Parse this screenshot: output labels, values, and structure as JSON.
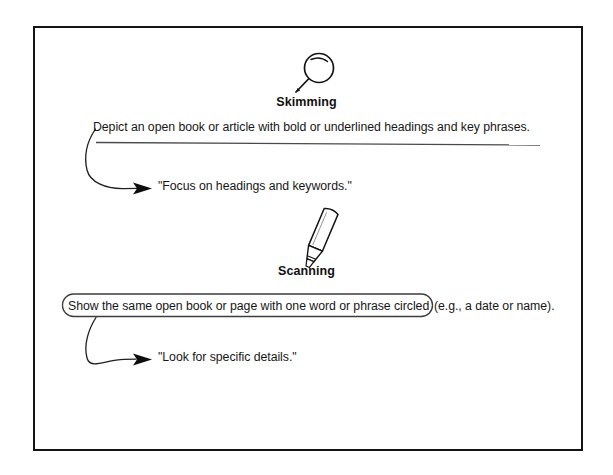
{
  "diagram": {
    "title_hidden": "",
    "sections": [
      {
        "id": "skimming",
        "icon": "magnifying-glass-icon",
        "heading": "Skimming",
        "description": "Depict an open book or article with bold or underlined headings and key phrases.",
        "description_style": "underlined",
        "quote": "\"Focus on headings and keywords.\""
      },
      {
        "id": "scanning",
        "icon": "highlighter-pen-icon",
        "heading": "Scanning",
        "description_circled": "Show the same open book or page with one word or phrase circled",
        "description_tail": "(e.g., a date or name).",
        "description_style": "circled",
        "quote": "\"Look for specific details.\""
      }
    ],
    "colors": {
      "ink": "#141414",
      "text": "#171717",
      "background": "#ffffff",
      "rule": "#4a4a4a"
    }
  }
}
